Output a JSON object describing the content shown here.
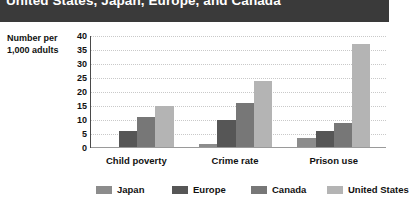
{
  "title": "United States, Japan, Europe, and Canada",
  "chart_data": {
    "type": "bar",
    "title": "United States, Japan, Europe, and Canada",
    "xlabel": "",
    "ylabel": "Number per 1,000 adults",
    "ylabel_lines": [
      "Number per",
      "1,000 adults"
    ],
    "categories": [
      "Child poverty",
      "Crime rate",
      "Prison use"
    ],
    "series": [
      {
        "name": "Japan",
        "color": "#8c8c8c",
        "values": [
          0.5,
          1.5,
          3.5
        ]
      },
      {
        "name": "Europe",
        "color": "#565656",
        "values": [
          6,
          10,
          6
        ]
      },
      {
        "name": "Canada",
        "color": "#777777",
        "values": [
          11,
          16,
          9
        ]
      },
      {
        "name": "United States",
        "color": "#b4b4b4",
        "values": [
          15,
          24,
          37
        ]
      }
    ],
    "ylim": [
      0,
      40
    ],
    "yticks": [
      0,
      5,
      10,
      15,
      20,
      25,
      30,
      35,
      40
    ],
    "ytick_labels": [
      "0",
      "5",
      "10",
      "15",
      "20",
      "25",
      "30",
      "35",
      "40"
    ],
    "grid": true,
    "legend_position": "bottom"
  },
  "colors": {
    "title_band": "#3a3a3a",
    "title_text": "#ffffff",
    "grid": "#c9c9c9",
    "axis": "#4a4a4a",
    "text": "#111111",
    "background": "#ffffff"
  }
}
